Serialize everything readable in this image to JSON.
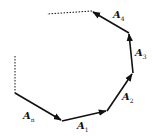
{
  "diagram": {
    "type": "vector polygon (head-to-tail vector sum)",
    "points": [
      [
        15,
        56
      ],
      [
        15,
        93
      ],
      [
        62,
        121
      ],
      [
        107,
        111
      ],
      [
        133,
        73
      ],
      [
        129,
        33
      ],
      [
        92,
        11
      ],
      [
        47,
        14
      ]
    ],
    "dotted_segments": [
      [
        [
          15,
          56
        ],
        [
          15,
          93
        ]
      ],
      [
        [
          92,
          11
        ],
        [
          47,
          14
        ]
      ]
    ],
    "vectors": [
      {
        "name": "A",
        "sub": "n",
        "from": [
          15,
          93
        ],
        "to": [
          62,
          121
        ],
        "label_pos": [
          23,
          111
        ]
      },
      {
        "name": "A",
        "sub": "1",
        "from": [
          62,
          121
        ],
        "to": [
          107,
          111
        ],
        "label_pos": [
          77,
          121
        ]
      },
      {
        "name": "A",
        "sub": "2",
        "from": [
          107,
          111
        ],
        "to": [
          133,
          73
        ],
        "label_pos": [
          122,
          92
        ]
      },
      {
        "name": "A",
        "sub": "3",
        "from": [
          133,
          73
        ],
        "to": [
          129,
          33
        ],
        "label_pos": [
          135,
          48
        ]
      },
      {
        "name": "A",
        "sub": "4",
        "from": [
          129,
          33
        ],
        "to": [
          92,
          11
        ],
        "label_pos": [
          113,
          10
        ]
      }
    ],
    "colors": {
      "line": "#111111",
      "background": "#ffffff"
    }
  }
}
